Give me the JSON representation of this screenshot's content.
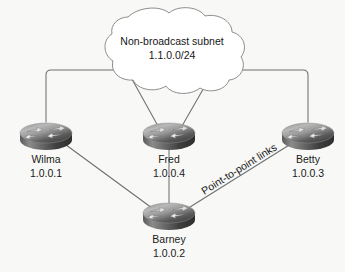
{
  "diagram": {
    "type": "network-topology",
    "background_color": "#f8f8f6",
    "cloud": {
      "name": "non-broadcast-subnet-cloud",
      "label_line1": "Non-broadcast subnet",
      "label_line2": "1.1.0.0/24",
      "outline_color": "#8a8a8a",
      "fill_color": "#ffffff"
    },
    "routers": [
      {
        "id": "wilma",
        "icon": "router-icon",
        "name": "Wilma",
        "address": "1.0.0.1",
        "position": "left"
      },
      {
        "id": "fred",
        "icon": "router-icon",
        "name": "Fred",
        "address": "1.0.0.4",
        "position": "center"
      },
      {
        "id": "betty",
        "icon": "router-icon",
        "name": "Betty",
        "address": "1.0.0.3",
        "position": "right"
      },
      {
        "id": "barney",
        "icon": "router-icon",
        "name": "Barney",
        "address": "1.0.0.2",
        "position": "bottom-center"
      }
    ],
    "annotations": [
      {
        "id": "point-to-point",
        "text": "Point-to-point links",
        "rotated": true
      }
    ],
    "links": [
      {
        "id": "wilma-cloud",
        "from": "wilma",
        "to": "cloud",
        "style": "orthogonal"
      },
      {
        "id": "betty-cloud",
        "from": "betty",
        "to": "cloud",
        "style": "orthogonal"
      },
      {
        "id": "fred-cloud-a",
        "from": "fred",
        "to": "cloud",
        "style": "diagonal"
      },
      {
        "id": "fred-cloud-b",
        "from": "fred",
        "to": "cloud",
        "style": "diagonal"
      },
      {
        "id": "wilma-barney",
        "from": "wilma",
        "to": "barney",
        "style": "straight"
      },
      {
        "id": "fred-barney",
        "from": "fred",
        "to": "barney",
        "style": "straight"
      },
      {
        "id": "barney-betty",
        "from": "barney",
        "to": "betty",
        "style": "straight"
      }
    ],
    "colors": {
      "line": "#6e6e6e",
      "router_top_light": "#d8d8d8",
      "router_top_dark": "#4a4a4a",
      "router_body_dark": "#3a3a3a",
      "text": "#161616"
    }
  }
}
